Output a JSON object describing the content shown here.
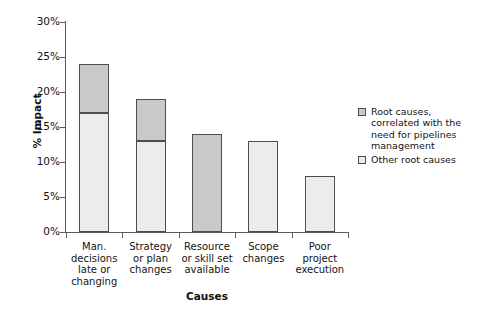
{
  "chart_data": {
    "type": "bar",
    "subtype": "stacked-bar",
    "title": "",
    "xlabel": "Causes",
    "ylabel": "% Impact",
    "ylim": [
      0,
      30
    ],
    "ytick_labels": [
      "30%",
      "25%",
      "20%",
      "15%",
      "10%",
      "5%",
      "0%"
    ],
    "ytick_values": [
      30,
      25,
      20,
      15,
      10,
      5,
      0
    ],
    "grid": false,
    "legend_position": "right",
    "categories": [
      "Man. decisions late or changing",
      "Strategy or plan changes",
      "Resource or skill set available",
      "Scope changes",
      "Poor project execution"
    ],
    "category_label_lines": [
      [
        "Man.",
        "decisions",
        "late or",
        "changing"
      ],
      [
        "Strategy",
        "or plan",
        "changes"
      ],
      [
        "Resource",
        "or skill set",
        "available"
      ],
      [
        "Scope",
        "changes"
      ],
      [
        "Poor",
        "project",
        "execution"
      ]
    ],
    "series": [
      {
        "name": "Other root causes",
        "color": "#ececec",
        "values": [
          17,
          13,
          0,
          13,
          8
        ]
      },
      {
        "name": "Root causes, correlated with the need for pipelines management",
        "color": "#c9c9c9",
        "values": [
          7,
          6,
          14,
          0,
          0
        ]
      }
    ],
    "totals": [
      24,
      19,
      14,
      13,
      8
    ]
  },
  "axes": {
    "y_title": "% Impact",
    "x_title": "Causes",
    "y_ticks": [
      {
        "label": "30%",
        "value": 30
      },
      {
        "label": "25%",
        "value": 25
      },
      {
        "label": "20%",
        "value": 20
      },
      {
        "label": "15%",
        "value": 15
      },
      {
        "label": "10%",
        "value": 10
      },
      {
        "label": "5%",
        "value": 5
      },
      {
        "label": "0%",
        "value": 0
      }
    ]
  },
  "legend": {
    "items": [
      {
        "label": "Root causes, correlated with the need for pipelines management",
        "swatch_color": "#c9c9c9"
      },
      {
        "label": "Other root causes",
        "swatch_color": "#ececec"
      }
    ]
  },
  "colors": {
    "series_dark": "#c9c9c9",
    "series_light": "#ececec",
    "bar_border": "#4d4d4d",
    "axis": "#5c5c5c",
    "text": "#141414",
    "background": "#ffffff"
  }
}
